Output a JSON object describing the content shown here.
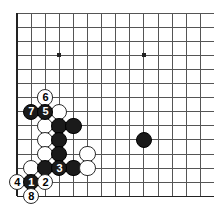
{
  "board": {
    "title": "Go game diagram, bottom-left corner",
    "cols": 14,
    "rows": 14,
    "origin_x": 17,
    "origin_y": 13,
    "spacing": 14.1,
    "line_color": "#555555",
    "edge_color": "#222222",
    "background_color": "#ffffff",
    "star_points": [
      {
        "col": 3,
        "row": 3
      },
      {
        "col": 9,
        "row": 3
      }
    ]
  },
  "stones": [
    {
      "col": 2,
      "row": 6,
      "color": "white",
      "label": "6"
    },
    {
      "col": 1,
      "row": 7,
      "color": "black",
      "label": "7"
    },
    {
      "col": 2,
      "row": 7,
      "color": "black",
      "label": "5"
    },
    {
      "col": 3,
      "row": 7,
      "color": "white",
      "label": ""
    },
    {
      "col": 2,
      "row": 8,
      "color": "white",
      "label": ""
    },
    {
      "col": 3,
      "row": 8,
      "color": "black",
      "label": ""
    },
    {
      "col": 4,
      "row": 8,
      "color": "black",
      "label": ""
    },
    {
      "col": 2,
      "row": 9,
      "color": "white",
      "label": ""
    },
    {
      "col": 3,
      "row": 9,
      "color": "black",
      "label": ""
    },
    {
      "col": 2,
      "row": 10,
      "color": "white",
      "label": ""
    },
    {
      "col": 3,
      "row": 10,
      "color": "black",
      "label": ""
    },
    {
      "col": 5,
      "row": 10,
      "color": "white",
      "label": ""
    },
    {
      "col": 1,
      "row": 11,
      "color": "white",
      "label": ""
    },
    {
      "col": 2,
      "row": 11,
      "color": "black",
      "label": ""
    },
    {
      "col": 3,
      "row": 11,
      "color": "black",
      "label": "3"
    },
    {
      "col": 4,
      "row": 11,
      "color": "black",
      "label": ""
    },
    {
      "col": 5,
      "row": 11,
      "color": "white",
      "label": ""
    },
    {
      "col": 0,
      "row": 12,
      "color": "white",
      "label": "4"
    },
    {
      "col": 1,
      "row": 12,
      "color": "black",
      "label": "1"
    },
    {
      "col": 2,
      "row": 12,
      "color": "white",
      "label": "2"
    },
    {
      "col": 1,
      "row": 13,
      "color": "white",
      "label": "8"
    },
    {
      "col": 9,
      "row": 9,
      "color": "black",
      "label": ""
    }
  ],
  "stone_radius": 8.2
}
